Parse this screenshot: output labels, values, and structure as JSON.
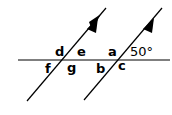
{
  "diagram": {
    "stroke_color": "#000000",
    "background": "#ffffff",
    "transversal": {
      "x1": 18,
      "y1": 60,
      "x2": 170,
      "y2": 60
    },
    "parallel_lines": [
      {
        "id": "left",
        "x1": 27,
        "y1": 101,
        "x2": 106,
        "y2": 8,
        "arrow": true
      },
      {
        "id": "right",
        "x1": 84,
        "y1": 100,
        "x2": 162,
        "y2": 8,
        "arrow": true
      }
    ],
    "angle_labels": [
      {
        "id": "d",
        "text": "d",
        "x": 55,
        "y": 55
      },
      {
        "id": "e",
        "text": "e",
        "x": 77,
        "y": 55
      },
      {
        "id": "f",
        "text": "f",
        "x": 45,
        "y": 72
      },
      {
        "id": "g",
        "text": "g",
        "x": 67,
        "y": 72
      },
      {
        "id": "a",
        "text": "a",
        "x": 108,
        "y": 55
      },
      {
        "id": "b",
        "text": "b",
        "x": 96,
        "y": 72
      },
      {
        "id": "c",
        "text": "c",
        "x": 118,
        "y": 70
      }
    ],
    "given_angle": {
      "text": "50°",
      "x": 130,
      "y": 55
    }
  }
}
